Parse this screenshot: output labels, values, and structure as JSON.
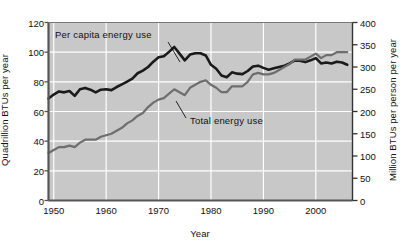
{
  "chart_data": {
    "type": "line",
    "title": "",
    "xlabel": "Year",
    "ylabel_left": "Quadrillion BTUs per year",
    "ylabel_right": "Million BTUs per person per year",
    "xlim": [
      1949,
      2007
    ],
    "xticks": [
      1950,
      1960,
      1970,
      1980,
      1990,
      2000
    ],
    "xtick_labels": [
      "1950",
      "1960",
      "1970",
      "1980",
      "1990",
      "2000"
    ],
    "ylim_left": [
      0,
      120
    ],
    "yticks_left": [
      0,
      20,
      40,
      60,
      80,
      100,
      120
    ],
    "ytick_labels_left": [
      "0",
      "20",
      "40",
      "60",
      "80",
      "100",
      "120"
    ],
    "ylim_right": [
      0,
      400
    ],
    "yticks_right": [
      0,
      50,
      100,
      150,
      200,
      250,
      300,
      350,
      400
    ],
    "ytick_labels_right": [
      "0",
      "50",
      "100",
      "150",
      "200",
      "250",
      "300",
      "350",
      "400"
    ],
    "grid": true,
    "grid_color": "#ffffff",
    "plot_background": "#c8c8c8",
    "legend_position": "inline-annotations",
    "series": [
      {
        "name": "Per capita energy use",
        "axis": "right",
        "color": "#1a1a1a",
        "annotation_label": "Per capita energy use",
        "x": [
          1949,
          1950,
          1951,
          1952,
          1953,
          1954,
          1955,
          1956,
          1957,
          1958,
          1959,
          1960,
          1961,
          1962,
          1963,
          1964,
          1965,
          1966,
          1967,
          1968,
          1969,
          1970,
          1971,
          1972,
          1973,
          1974,
          1975,
          1976,
          1977,
          1978,
          1979,
          1980,
          1981,
          1982,
          1983,
          1984,
          1985,
          1986,
          1987,
          1988,
          1989,
          1990,
          1991,
          1992,
          1993,
          1994,
          1995,
          1996,
          1997,
          1998,
          1999,
          2000,
          2001,
          2002,
          2003,
          2004,
          2005,
          2006
        ],
        "values": [
          229,
          238,
          245,
          243,
          246,
          235,
          250,
          253,
          249,
          243,
          249,
          250,
          248,
          255,
          261,
          267,
          274,
          286,
          292,
          300,
          312,
          322,
          324,
          334,
          345,
          330,
          315,
          328,
          331,
          331,
          326,
          305,
          296,
          281,
          277,
          288,
          285,
          284,
          291,
          301,
          303,
          298,
          294,
          297,
          300,
          303,
          308,
          315,
          314,
          311,
          315,
          320,
          308,
          310,
          308,
          312,
          310,
          305
        ]
      },
      {
        "name": "Total energy use",
        "axis": "left",
        "color": "#6e6e6e",
        "annotation_label": "Total energy use",
        "x": [
          1949,
          1950,
          1951,
          1952,
          1953,
          1954,
          1955,
          1956,
          1957,
          1958,
          1959,
          1960,
          1961,
          1962,
          1963,
          1964,
          1965,
          1966,
          1967,
          1968,
          1969,
          1970,
          1971,
          1972,
          1973,
          1974,
          1975,
          1976,
          1977,
          1978,
          1979,
          1980,
          1981,
          1982,
          1983,
          1984,
          1985,
          1986,
          1987,
          1988,
          1989,
          1990,
          1991,
          1992,
          1993,
          1994,
          1995,
          1996,
          1997,
          1998,
          1999,
          2000,
          2001,
          2002,
          2003,
          2004,
          2005,
          2006
        ],
        "values": [
          32,
          34,
          36,
          36,
          37,
          36,
          39,
          41,
          41,
          41,
          43,
          44,
          45,
          47,
          49,
          52,
          54,
          57,
          59,
          63,
          66,
          68,
          69,
          72,
          75,
          73,
          71,
          76,
          78,
          80,
          81,
          78,
          76,
          73,
          73,
          77,
          77,
          77,
          80,
          85,
          86,
          85,
          85,
          86,
          88,
          90,
          92,
          95,
          95,
          95,
          97,
          99,
          96,
          98,
          98,
          100,
          100,
          100
        ]
      }
    ]
  }
}
